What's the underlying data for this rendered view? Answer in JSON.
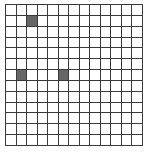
{
  "grid": {
    "rows": 13,
    "cols": 13,
    "line_color": "#3a3a3a",
    "empty_color": "#ffffff",
    "fill_color": "#666666",
    "filled_cells": [
      {
        "row": 1,
        "col": 2
      },
      {
        "row": 6,
        "col": 1
      },
      {
        "row": 6,
        "col": 5
      }
    ]
  }
}
